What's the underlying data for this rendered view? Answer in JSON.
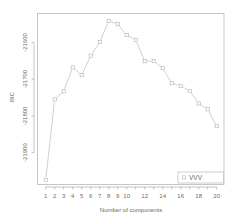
{
  "chart_data": {
    "type": "line",
    "title": "",
    "xlabel": "Number of components",
    "ylabel": "BIC",
    "x": [
      1,
      2,
      3,
      4,
      5,
      6,
      7,
      8,
      9,
      10,
      11,
      12,
      13,
      14,
      15,
      16,
      17,
      18,
      19,
      20
    ],
    "series": [
      {
        "name": "VVV",
        "marker": "open-square",
        "color": "#b0b0b0",
        "values": [
          -21974,
          -21755,
          -21733,
          -21668,
          -21689,
          -21636,
          -21599,
          -21541,
          -21550,
          -21580,
          -21593,
          -21651,
          -21651,
          -21670,
          -21711,
          -21718,
          -21732,
          -21766,
          -21782,
          -21828
        ]
      }
    ],
    "xlim": [
      0.5,
      20.8
    ],
    "ylim": [
      -22010,
      -21520
    ],
    "x_ticks": [
      1,
      2,
      3,
      4,
      5,
      6,
      7,
      8,
      9,
      10,
      12,
      14,
      16,
      18,
      20
    ],
    "x_tick_marks": [
      1,
      2,
      3,
      4,
      5,
      6,
      7,
      8,
      9,
      10,
      11,
      12,
      13,
      14,
      15,
      16,
      17,
      18,
      19,
      20
    ],
    "y_ticks": [
      -21600,
      -21700,
      -21800,
      -21900
    ],
    "grid": false,
    "legend_position": "bottom-right"
  },
  "labels": {
    "xlabel": "Number of components",
    "ylabel": "BIC",
    "legend": "VVV"
  }
}
